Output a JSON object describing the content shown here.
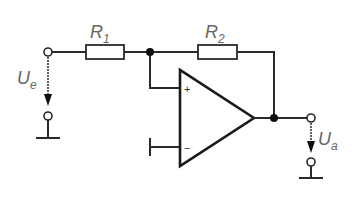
{
  "diagram": {
    "type": "circuit-schematic",
    "components": {
      "r1": {
        "label": "R",
        "subscript": "1"
      },
      "r2": {
        "label": "R",
        "subscript": "2"
      },
      "opamp": {
        "plus": "+",
        "minus": "−"
      }
    },
    "voltages": {
      "input": {
        "label": "U",
        "subscript": "e"
      },
      "output": {
        "label": "U",
        "subscript": "a"
      }
    },
    "colors": {
      "wire": "#2a2a2a",
      "label": "#666666",
      "background": "#ffffff"
    }
  }
}
